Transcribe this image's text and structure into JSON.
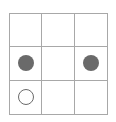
{
  "board": {
    "rows": 3,
    "cols": 3,
    "cells": [
      "",
      "",
      "",
      "filled",
      "",
      "filled",
      "empty",
      "",
      ""
    ]
  },
  "colors": {
    "grid": "#a8a8a8",
    "piece": "#6a6a6a",
    "background": "#ffffff"
  }
}
